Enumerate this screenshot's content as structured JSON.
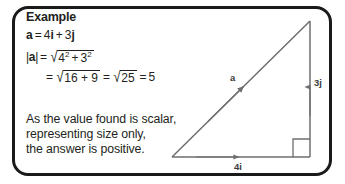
{
  "card": {
    "heading": "Example",
    "definition": {
      "vector_name": "a",
      "equals": "=",
      "expression": "4i + 3j",
      "i_component": "4i",
      "plus": "+",
      "j_component": "3j"
    },
    "magnitude_line_1": {
      "lhs": "|a|",
      "equals": "=",
      "sqrt": "√",
      "radicand_first": "4",
      "exp_first": "2",
      "plus": "+",
      "radicand_second": "3",
      "exp_second": "2"
    },
    "magnitude_line_2": {
      "equals_1": "=",
      "sqrt_1": "√",
      "radicand_1": "16 + 9",
      "equals_2": "=",
      "sqrt_2": "√",
      "radicand_2": "25",
      "equals_3": "=",
      "result": "5"
    },
    "prose": [
      "As the value found is scalar,",
      "representing size only,",
      "the answer is positive."
    ]
  },
  "diagram": {
    "type": "right-triangle-vector",
    "labels": {
      "hypotenuse": "a",
      "vertical": "3j",
      "horizontal": "4i"
    },
    "geometry": {
      "origin_x": 172,
      "origin_y": 157,
      "apex_x": 310,
      "apex_y": 21,
      "corner_x": 310,
      "corner_y": 157,
      "right_angle_marker": "square"
    },
    "colors": {
      "line": "#6d6e71",
      "border": "#1a1a1a",
      "text": "#231f20",
      "background": "#ffffff"
    }
  }
}
